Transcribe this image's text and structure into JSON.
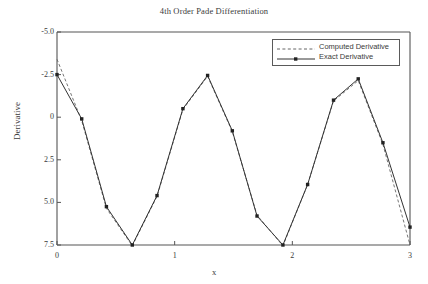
{
  "figure": {
    "title": "4th Order Pade Differentiation",
    "background": "#ffffff",
    "frame_color": "#555555"
  },
  "axes": {
    "x_label": "x",
    "y_label": "Derivative",
    "x_ticks": [
      "0",
      "1",
      "2",
      "3"
    ],
    "y_ticks": [
      "7.5",
      "5.0",
      "2.5",
      "0",
      "-2.5",
      "-5.0"
    ]
  },
  "legend": {
    "items": [
      {
        "label": "Computed Derivative",
        "style": "dashed",
        "marker": "none",
        "color": "#555555"
      },
      {
        "label": "Exact Derivative",
        "style": "solid",
        "marker": "square",
        "color": "#333333"
      }
    ]
  },
  "chart_data": {
    "type": "line",
    "title": "4th Order Pade Differentiation",
    "xlabel": "x",
    "ylabel": "Derivative",
    "xlim": [
      0,
      3
    ],
    "ylim": [
      -5.0,
      7.5
    ],
    "xticks": [
      0,
      1,
      2,
      3
    ],
    "yticks": [
      -5.0,
      -2.5,
      0,
      2.5,
      5.0,
      7.5
    ],
    "grid": false,
    "legend_position": "upper right",
    "series": [
      {
        "name": "Computed Derivative",
        "style": "dashed",
        "marker": "none",
        "color": "#666666",
        "x": [
          0.0,
          0.21,
          0.42,
          0.64,
          0.85,
          1.07,
          1.28,
          1.49,
          1.7,
          1.92,
          2.13,
          2.35,
          2.56,
          2.77,
          3.0
        ],
        "y": [
          5.9,
          2.3,
          -2.85,
          -5.05,
          -2.15,
          2.95,
          4.9,
          1.65,
          -3.25,
          -5.05,
          -1.45,
          3.45,
          4.65,
          0.9,
          -5.0
        ]
      },
      {
        "name": "Exact Derivative",
        "style": "solid",
        "marker": "square",
        "color": "#333333",
        "x": [
          0.0,
          0.21,
          0.42,
          0.64,
          0.85,
          1.07,
          1.28,
          1.49,
          1.7,
          1.92,
          2.13,
          2.35,
          2.56,
          2.77,
          3.0
        ],
        "y": [
          5.0,
          2.4,
          -2.75,
          -5.0,
          -2.1,
          3.0,
          4.95,
          1.7,
          -3.3,
          -5.0,
          -1.45,
          3.5,
          4.75,
          1.0,
          -3.95
        ]
      }
    ]
  }
}
